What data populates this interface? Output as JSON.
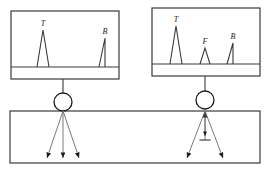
{
  "figure": {
    "line_color": "#3a3a3a",
    "fill_color": "#ffffff",
    "label_color": "#1a1a1a"
  },
  "scopes": [
    {
      "id": "left-scope",
      "name": "scope-no-flaw",
      "x": 11,
      "y": 11,
      "w": 108,
      "h": 68,
      "baseline_y": 56,
      "peaks": [
        {
          "label": "T",
          "name": "peak-transmission",
          "x": 32,
          "height": 37,
          "half_width": 6,
          "shape": "symmetric",
          "label_dx": 0,
          "label_dy": -4
        },
        {
          "label": "B",
          "name": "peak-backwall",
          "x": 94,
          "height": 29,
          "half_width": 6,
          "shape": "right-vertical",
          "label_dx": 0,
          "label_dy": -4
        }
      ]
    },
    {
      "id": "right-scope",
      "name": "scope-with-flaw",
      "x": 152,
      "y": 8,
      "w": 108,
      "h": 68,
      "baseline_y": 56,
      "peaks": [
        {
          "label": "T",
          "name": "peak-transmission",
          "x": 24,
          "height": 38,
          "half_width": 6,
          "shape": "symmetric",
          "label_dx": 0,
          "label_dy": -4
        },
        {
          "label": "F",
          "name": "peak-flaw",
          "x": 53,
          "height": 16,
          "half_width": 5,
          "shape": "symmetric",
          "label_dx": 0,
          "label_dy": -4
        },
        {
          "label": "B",
          "name": "peak-backwall",
          "x": 81,
          "height": 21,
          "half_width": 6,
          "shape": "right-vertical",
          "label_dx": 0,
          "label_dy": -4
        }
      ]
    }
  ],
  "specimen": {
    "name": "test-specimen-block",
    "x": 10,
    "y": 111,
    "w": 250,
    "h": 52
  },
  "probes": [
    {
      "id": "left-probe",
      "name": "probe-left",
      "cable_x": 63,
      "cable_top": 79,
      "cable_bottom": 95,
      "circle_cx": 63,
      "circle_cy": 102,
      "circle_r": 9,
      "contact_x": 63,
      "contact_y": 111,
      "flaw": false,
      "beams": [
        {
          "name": "beam-left",
          "x2": 47,
          "y2": 158
        },
        {
          "name": "beam-center",
          "x2": 63,
          "y2": 158
        },
        {
          "name": "beam-right",
          "x2": 79,
          "y2": 158
        }
      ]
    },
    {
      "id": "right-probe",
      "name": "probe-right",
      "cable_x": 205,
      "cable_top": 76,
      "cable_bottom": 92,
      "circle_cx": 205,
      "circle_cy": 100,
      "circle_r": 9,
      "contact_x": 205,
      "contact_y": 111,
      "flaw": true,
      "flaw_mark": {
        "name": "flaw-indicator",
        "x": 205,
        "y": 140,
        "width": 11
      },
      "echo_arrow": {
        "name": "echo-return-arrow",
        "from_y": 140,
        "to_y": 112
      },
      "flaw_arrow": {
        "name": "flaw-incident-arrow",
        "from_y": 112,
        "to_y": 136
      },
      "beams": [
        {
          "name": "beam-left",
          "x2": 187,
          "y2": 158
        },
        {
          "name": "beam-right",
          "x2": 223,
          "y2": 158
        }
      ]
    }
  ]
}
